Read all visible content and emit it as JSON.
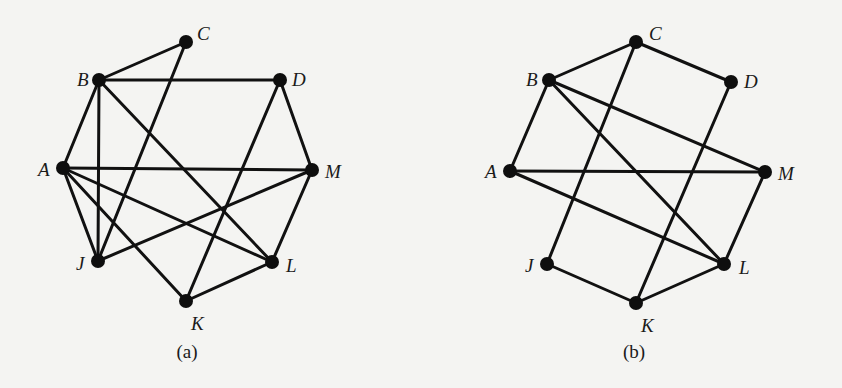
{
  "figure": {
    "graphs": [
      {
        "id": "a",
        "caption": "(a)",
        "caption_pos": [
          187,
          358
        ],
        "nodes": [
          {
            "name": "C",
            "x": 186,
            "y": 42,
            "lx": 197,
            "ly": 40
          },
          {
            "name": "B",
            "x": 99,
            "y": 80,
            "lx": 77,
            "ly": 86
          },
          {
            "name": "D",
            "x": 280,
            "y": 80,
            "lx": 292,
            "ly": 86
          },
          {
            "name": "A",
            "x": 63,
            "y": 168,
            "lx": 38,
            "ly": 176
          },
          {
            "name": "M",
            "x": 312,
            "y": 170,
            "lx": 325,
            "ly": 178
          },
          {
            "name": "J",
            "x": 98,
            "y": 261,
            "lx": 76,
            "ly": 270
          },
          {
            "name": "L",
            "x": 272,
            "y": 262,
            "lx": 286,
            "ly": 272
          },
          {
            "name": "K",
            "x": 186,
            "y": 301,
            "lx": 191,
            "ly": 330
          }
        ],
        "edges": [
          [
            "B",
            "C"
          ],
          [
            "B",
            "D"
          ],
          [
            "B",
            "A"
          ],
          [
            "B",
            "J"
          ],
          [
            "B",
            "L"
          ],
          [
            "C",
            "J"
          ],
          [
            "D",
            "M"
          ],
          [
            "D",
            "K"
          ],
          [
            "A",
            "M"
          ],
          [
            "A",
            "J"
          ],
          [
            "A",
            "K"
          ],
          [
            "A",
            "L"
          ],
          [
            "M",
            "J"
          ],
          [
            "M",
            "L"
          ],
          [
            "L",
            "K"
          ]
        ]
      },
      {
        "id": "b",
        "caption": "(b)",
        "caption_pos": [
          634,
          358
        ],
        "nodes": [
          {
            "name": "C",
            "x": 636,
            "y": 42,
            "lx": 649,
            "ly": 40
          },
          {
            "name": "B",
            "x": 549,
            "y": 80,
            "lx": 526,
            "ly": 86
          },
          {
            "name": "D",
            "x": 731,
            "y": 82,
            "lx": 744,
            "ly": 88
          },
          {
            "name": "A",
            "x": 510,
            "y": 171,
            "lx": 485,
            "ly": 178
          },
          {
            "name": "M",
            "x": 765,
            "y": 172,
            "lx": 778,
            "ly": 180
          },
          {
            "name": "J",
            "x": 547,
            "y": 264,
            "lx": 525,
            "ly": 272
          },
          {
            "name": "L",
            "x": 724,
            "y": 264,
            "lx": 739,
            "ly": 274
          },
          {
            "name": "K",
            "x": 636,
            "y": 303,
            "lx": 641,
            "ly": 332
          }
        ],
        "edges": [
          [
            "B",
            "C"
          ],
          [
            "C",
            "D"
          ],
          [
            "C",
            "J"
          ],
          [
            "B",
            "A"
          ],
          [
            "B",
            "M"
          ],
          [
            "B",
            "L"
          ],
          [
            "D",
            "K"
          ],
          [
            "A",
            "M"
          ],
          [
            "A",
            "L"
          ],
          [
            "M",
            "L"
          ],
          [
            "J",
            "K"
          ],
          [
            "K",
            "L"
          ]
        ]
      }
    ]
  }
}
